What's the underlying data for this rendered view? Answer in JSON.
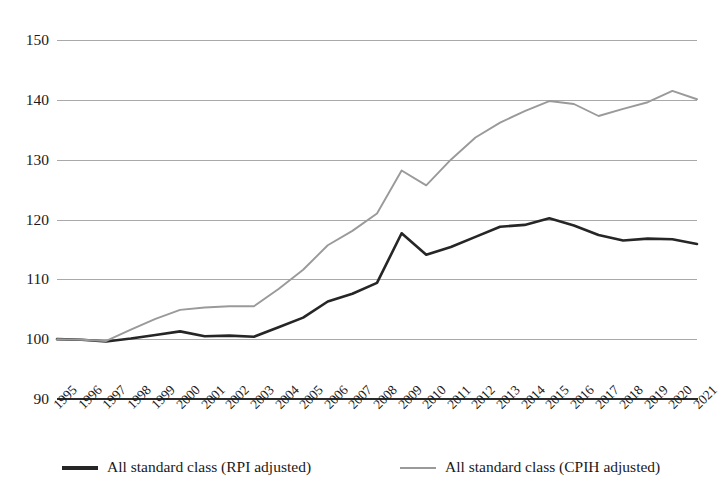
{
  "chart_data": {
    "type": "line",
    "title": "",
    "subtitle": "",
    "xlabel": "",
    "ylabel": "",
    "xlim": [
      1995,
      2021
    ],
    "ylim": [
      90,
      150
    ],
    "yticks": [
      90,
      100,
      110,
      120,
      130,
      140,
      150
    ],
    "grid": true,
    "legend_position": "bottom",
    "x": [
      1995,
      1996,
      1997,
      1998,
      1999,
      2000,
      2001,
      2002,
      2003,
      2004,
      2005,
      2006,
      2007,
      2008,
      2009,
      2010,
      2011,
      2012,
      2013,
      2014,
      2015,
      2016,
      2017,
      2018,
      2019,
      2020,
      2021
    ],
    "categories": [
      "1995",
      "1996",
      "1997",
      "1998",
      "1999",
      "2000",
      "2001",
      "2002",
      "2003",
      "2004",
      "2005",
      "2006",
      "2007",
      "2008",
      "2009",
      "2010",
      "2011",
      "2012",
      "2013",
      "2014",
      "2015",
      "2016",
      "2017",
      "2018",
      "2019",
      "2020",
      "2021"
    ],
    "series": [
      {
        "name": "All standard class (RPI adjusted)",
        "color": "#262626",
        "linewidth": 2.6,
        "values": [
          100.0,
          99.9,
          99.6,
          100.1,
          100.7,
          101.3,
          100.5,
          100.6,
          100.4,
          102.0,
          103.6,
          106.3,
          107.6,
          109.4,
          117.7,
          114.1,
          115.4,
          117.1,
          118.8,
          119.1,
          120.2,
          119.0,
          117.4,
          116.5,
          116.8,
          116.7,
          115.9
        ]
      },
      {
        "name": "All standard class (CPIH adjusted)",
        "color": "#9a9a9a",
        "linewidth": 1.9,
        "values": [
          100.0,
          99.9,
          99.7,
          101.6,
          103.4,
          104.9,
          105.3,
          105.5,
          105.5,
          108.4,
          111.6,
          115.7,
          118.1,
          121.0,
          128.2,
          125.7,
          130.0,
          133.7,
          136.2,
          138.1,
          139.8,
          139.3,
          137.3,
          138.5,
          139.6,
          141.5,
          140.1
        ]
      }
    ]
  },
  "legend": {
    "items": [
      {
        "label": "All standard class (RPI adjusted)",
        "color": "#262626"
      },
      {
        "label": "All standard class (CPIH adjusted)",
        "color": "#9a9a9a"
      }
    ]
  },
  "axes": {
    "y_tick_labels": [
      "150",
      "140",
      "130",
      "120",
      "110",
      "100",
      "90"
    ],
    "x_tick_labels": [
      "1995",
      "1996",
      "1997",
      "1998",
      "1999",
      "2000",
      "2001",
      "2002",
      "2003",
      "2004",
      "2005",
      "2006",
      "2007",
      "2008",
      "2009",
      "2010",
      "2011",
      "2012",
      "2013",
      "2014",
      "2015",
      "2016",
      "2017",
      "2018",
      "2019",
      "2020",
      "2021"
    ]
  }
}
